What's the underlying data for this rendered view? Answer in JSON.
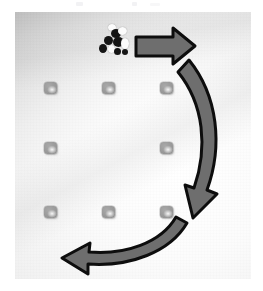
{
  "page": {
    "background_color": "#ffffff",
    "width": 263,
    "height": 291
  },
  "photo": {
    "alt_text": "Overhead photo of a light gray cloth surface with a 3x3 grid of small gray rounded-square markers, a small black-and-white toy figurine near the top, and three overlaid arrows indicating a clockwise path.",
    "surface_color": "#f5f5f5",
    "vignette_color": "#b8b8b8",
    "bounds": {
      "left": 15,
      "top": 12,
      "width": 236,
      "height": 267
    }
  },
  "figurine": {
    "label": "toy-figure",
    "description": "small black and white spotted toy animal",
    "body_color": "#141414",
    "highlight_color": "#fbfbfb",
    "position": {
      "x": 105,
      "y": 36
    }
  },
  "grid": {
    "rows": 3,
    "columns": 3,
    "marker_color": "#9a9a9a",
    "marker_label": "grid-marker",
    "column_x": [
      51,
      109,
      167
    ],
    "row_y": [
      88,
      148,
      212
    ],
    "markers": [
      {
        "row": 0,
        "col": 0,
        "x": 51,
        "y": 88,
        "present": true
      },
      {
        "row": 0,
        "col": 1,
        "x": 109,
        "y": 88,
        "present": true
      },
      {
        "row": 0,
        "col": 2,
        "x": 167,
        "y": 88,
        "present": true
      },
      {
        "row": 1,
        "col": 0,
        "x": 51,
        "y": 148,
        "present": true
      },
      {
        "row": 1,
        "col": 1,
        "x": 109,
        "y": 148,
        "present": false
      },
      {
        "row": 1,
        "col": 2,
        "x": 167,
        "y": 148,
        "present": true
      },
      {
        "row": 2,
        "col": 0,
        "x": 51,
        "y": 212,
        "present": true
      },
      {
        "row": 2,
        "col": 1,
        "x": 109,
        "y": 212,
        "present": true
      },
      {
        "row": 2,
        "col": 2,
        "x": 167,
        "y": 212,
        "present": true
      }
    ]
  },
  "arrows": {
    "fill_color": "#6e6e6e",
    "outline_color": "#0d0d0d",
    "items": [
      {
        "name": "arrow-right-top",
        "shape": "straight",
        "direction": "right",
        "description": "straight arrow pointing right across the top of the grid"
      },
      {
        "name": "arrow-curved-down-right",
        "shape": "curved",
        "direction": "down",
        "description": "long curved arrow sweeping down along the right side"
      },
      {
        "name": "arrow-curved-left-bottom",
        "shape": "curved",
        "direction": "left",
        "description": "curved arrow pointing left along the bottom"
      }
    ]
  }
}
